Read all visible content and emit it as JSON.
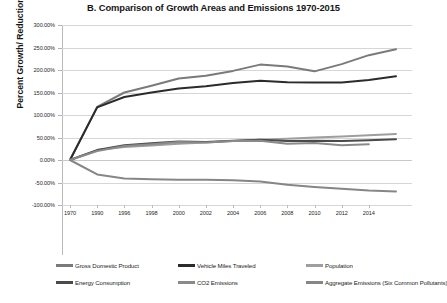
{
  "title": "B. Comparison of Growth Areas and Emissions 1970-2015",
  "axes": {
    "ylabel": "Percent Growth/ Reduction",
    "yticks": [
      "300.00%",
      "250.00%",
      "200.00%",
      "150.00%",
      "100.00%",
      "50.00%",
      "0.00%",
      "-50.00%",
      "-100.00%"
    ],
    "xticks": [
      "1970",
      "1990",
      "1996",
      "1998",
      "2000",
      "2002",
      "2004",
      "2006",
      "2008",
      "2010",
      "2012",
      "2014"
    ]
  },
  "legend": {
    "row1": [
      {
        "label": "Gross Domestic Product",
        "color": "#7a7a7a"
      },
      {
        "label": "Vehicle Miles Traveled",
        "color": "#2b2b2b"
      },
      {
        "label": "Population",
        "color": "#9e9e9e"
      }
    ],
    "row2": [
      {
        "label": "Energy Consumption",
        "color": "#4a4a4a"
      },
      {
        "label": "CO2 Emissions",
        "color": "#8a8a8a"
      },
      {
        "label": "Aggregate Emissions (Six Common Pollutants)",
        "color": "#868686"
      }
    ]
  },
  "chart_data": {
    "type": "line",
    "title": "B. Comparison of Growth Areas and Emissions 1970-2015",
    "xlabel": "",
    "ylabel": "Percent Growth/ Reduction",
    "ylim": [
      -100,
      300
    ],
    "ytick_step": 50,
    "grid": true,
    "legend_position": "bottom",
    "categories": [
      "1970",
      "1990",
      "1996",
      "1998",
      "2000",
      "2002",
      "2004",
      "2006",
      "2008",
      "2010",
      "2012",
      "2014",
      "2015"
    ],
    "series": [
      {
        "name": "Gross Domestic Product",
        "color": "#7a7a7a",
        "values": [
          0,
          118,
          150,
          165,
          181,
          187,
          198,
          212,
          208,
          197,
          213,
          233,
          246
        ]
      },
      {
        "name": "Vehicle Miles Traveled",
        "color": "#2b2b2b",
        "values": [
          0,
          117,
          140,
          150,
          159,
          164,
          171,
          176,
          173,
          172,
          172,
          178,
          186
        ]
      },
      {
        "name": "Population",
        "color": "#9e9e9e",
        "values": [
          0,
          22,
          29,
          32,
          36,
          39,
          42,
          45,
          47,
          50,
          52,
          55,
          58
        ]
      },
      {
        "name": "Energy Consumption",
        "color": "#4a4a4a",
        "values": [
          0,
          22,
          33,
          37,
          41,
          40,
          43,
          45,
          42,
          43,
          42,
          44,
          46
        ]
      },
      {
        "name": "CO2 Emissions",
        "color": "#8a8a8a",
        "values": [
          0,
          20,
          31,
          35,
          40,
          39,
          42,
          43,
          36,
          38,
          33,
          35,
          null
        ]
      },
      {
        "name": "Aggregate Emissions (Six Common Pollutants)",
        "color": "#868686",
        "values": [
          0,
          -32,
          -41,
          -43,
          -44,
          -44,
          -45,
          -48,
          -55,
          -60,
          -64,
          -68,
          -70
        ]
      }
    ]
  }
}
